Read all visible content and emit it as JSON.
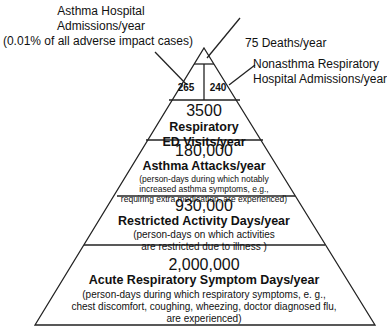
{
  "callouts": {
    "asthma_hosp": {
      "line1": "Asthma Hospital",
      "line2": "Admissions/year",
      "line3": "(0.01% of all adverse impact cases)"
    },
    "deaths": "75  Deaths/year",
    "nonasthma": {
      "line1": "Nonasthma Respiratory",
      "line2": "Hospital Admissions/year"
    }
  },
  "tiers": {
    "hosp_left": "265",
    "hosp_right": "240",
    "ed": {
      "num": "3500",
      "l1": "Respiratory",
      "l2": "ED Visits/year"
    },
    "attacks": {
      "num": "180,000",
      "l1": "Asthma Attacks/year",
      "s1": "(person-days during which notably",
      "s2": "increased asthma symptoms, e.g.,",
      "s3": "requiring extra medication, are experienced)"
    },
    "restricted": {
      "num": "930,000",
      "l1": "Restricted Activity Days/year",
      "s1": "(person-days on which  activities",
      "s2": "are restricted due to illness )"
    },
    "acute": {
      "num": "2,000,000",
      "l1": "Acute Respiratory Symptom Days/year",
      "s1": "(person-days during which respiratory symptoms, e. g.,",
      "s2": "chest discomfort, coughing, wheezing, doctor diagnosed flu,",
      "s3": "are experienced)"
    }
  }
}
